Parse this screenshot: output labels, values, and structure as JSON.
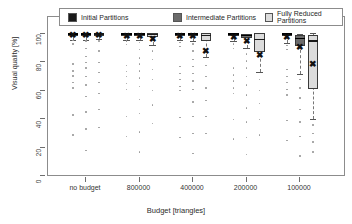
{
  "chart_data": {
    "type": "box",
    "title": "",
    "xlabel": "Budget [triangles]",
    "ylabel": "Visual quality [%]",
    "ylim": [
      0,
      103
    ],
    "yticks": [
      0,
      20,
      40,
      60,
      80,
      100
    ],
    "ytick_labels": [
      "0",
      "20",
      "40",
      "60",
      "80",
      "100"
    ],
    "categories": [
      "no budget",
      "800000",
      "400000",
      "200000",
      "100000"
    ],
    "grid": false,
    "legend_position": "top",
    "legend": [
      {
        "label": "Initial Partitions",
        "color": "#1a1a1a"
      },
      {
        "label": "Intermediate Partitions",
        "color": "#6b6b6b"
      },
      {
        "label": "Fully Reduced Partitions",
        "color": "#dcdcdc"
      }
    ],
    "series": [
      {
        "name": "Initial Partitions",
        "color": "#1a1a1a",
        "boxes": [
          {
            "category": "no budget",
            "q1": 99.2,
            "median": 100.0,
            "q3": 100.0,
            "lower_whisker": 96.0,
            "upper_whisker": 100.0,
            "mean": 99.0,
            "outliers": [
              95.5,
              93.0,
              79.0,
              74.0,
              70.5,
              66.0,
              62.0,
              43.0,
              29.0
            ]
          },
          {
            "category": "800000",
            "q1": 99.2,
            "median": 100.0,
            "q3": 100.0,
            "lower_whisker": 96.0,
            "upper_whisker": 100.0,
            "mean": 98.8,
            "outliers": [
              95.0,
              92.5,
              78.0,
              73.5,
              70.0,
              65.0,
              61.0,
              42.0,
              28.0
            ]
          },
          {
            "category": "400000",
            "q1": 99.0,
            "median": 100.0,
            "q3": 100.0,
            "lower_whisker": 95.5,
            "upper_whisker": 100.0,
            "mean": 98.5,
            "outliers": [
              94.0,
              91.0,
              77.0,
              72.0,
              68.0,
              63.0,
              60.0,
              41.0,
              27.0
            ]
          },
          {
            "category": "200000",
            "q1": 98.8,
            "median": 100.0,
            "q3": 100.0,
            "lower_whisker": 95.0,
            "upper_whisker": 100.0,
            "mean": 98.2,
            "outliers": [
              93.0,
              90.0,
              76.0,
              71.0,
              67.0,
              62.0,
              58.0,
              40.0,
              26.0
            ]
          },
          {
            "category": "100000",
            "q1": 98.5,
            "median": 100.0,
            "q3": 100.0,
            "lower_whisker": 94.0,
            "upper_whisker": 100.0,
            "mean": 98.0,
            "outliers": [
              92.0,
              89.0,
              75.0,
              70.0,
              66.0,
              61.0,
              57.0,
              39.0,
              25.0
            ]
          }
        ]
      },
      {
        "name": "Intermediate Partitions",
        "color": "#6b6b6b",
        "boxes": [
          {
            "category": "no budget",
            "q1": 99.2,
            "median": 100.0,
            "q3": 100.0,
            "lower_whisker": 96.0,
            "upper_whisker": 100.0,
            "mean": 99.0,
            "outliers": [
              95.0,
              90.0,
              84.0,
              80.0,
              76.0,
              70.0,
              64.0,
              56.0,
              45.0,
              33.0,
              18.0
            ]
          },
          {
            "category": "800000",
            "q1": 99.0,
            "median": 100.0,
            "q3": 100.0,
            "lower_whisker": 95.5,
            "upper_whisker": 100.0,
            "mean": 98.7,
            "outliers": [
              94.0,
              89.0,
              83.0,
              79.0,
              74.0,
              69.0,
              63.0,
              54.0,
              44.0,
              31.0,
              17.0
            ]
          },
          {
            "category": "400000",
            "q1": 98.8,
            "median": 100.0,
            "q3": 100.0,
            "lower_whisker": 95.0,
            "upper_whisker": 100.0,
            "mean": 98.4,
            "outliers": [
              93.0,
              88.0,
              82.0,
              77.0,
              72.0,
              67.0,
              61.0,
              52.0,
              42.0,
              30.0,
              16.0
            ]
          },
          {
            "category": "200000",
            "q1": 97.0,
            "median": 99.0,
            "q3": 100.0,
            "lower_whisker": 90.0,
            "upper_whisker": 100.0,
            "mean": 95.0,
            "outliers": [
              86.0,
              81.0,
              76.0,
              70.0,
              64.0,
              57.0,
              48.0,
              38.0,
              27.0,
              15.0
            ]
          },
          {
            "category": "100000",
            "q1": 91.5,
            "median": 97.0,
            "q3": 99.5,
            "lower_whisker": 72.0,
            "upper_whisker": 100.0,
            "mean": 91.0,
            "outliers": [
              68.0,
              62.0,
              55.0,
              47.0,
              38.0,
              28.0,
              14.0
            ]
          }
        ]
      },
      {
        "name": "Fully Reduced Partitions",
        "color": "#dcdcdc",
        "boxes": [
          {
            "category": "no budget",
            "q1": 99.2,
            "median": 100.0,
            "q3": 100.0,
            "lower_whisker": 96.5,
            "upper_whisker": 100.0,
            "mean": 99.2,
            "outliers": [
              95.0,
              88.0,
              80.0,
              73.0,
              66.0,
              58.0,
              47.0,
              34.0
            ]
          },
          {
            "category": "800000",
            "q1": 98.0,
            "median": 99.5,
            "q3": 100.5,
            "lower_whisker": 92.0,
            "upper_whisker": 101.0,
            "mean": 96.5,
            "outliers": [
              88.0,
              82.0,
              75.0,
              68.0,
              60.0,
              50.0,
              37.0
            ]
          },
          {
            "category": "400000",
            "q1": 95.0,
            "median": 99.0,
            "q3": 100.5,
            "lower_whisker": 84.0,
            "upper_whisker": 101.0,
            "mean": 88.0,
            "outliers": [
              78.0,
              70.0,
              62.0,
              53.0,
              42.0,
              30.0
            ]
          },
          {
            "category": "200000",
            "q1": 87.0,
            "median": 96.0,
            "q3": 100.5,
            "lower_whisker": 73.0,
            "upper_whisker": 101.0,
            "mean": 85.0,
            "outliers": [
              68.0,
              60.0,
              51.0,
              40.0,
              29.0
            ]
          },
          {
            "category": "100000",
            "q1": 61.0,
            "median": 95.0,
            "q3": 99.5,
            "lower_whisker": 40.0,
            "upper_whisker": 101.0,
            "mean": 79.0,
            "outliers": [
              36.0,
              30.0,
              24.0,
              17.0
            ]
          }
        ]
      }
    ]
  }
}
